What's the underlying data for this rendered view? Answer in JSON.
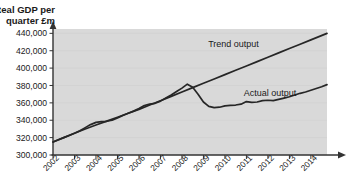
{
  "chart_data": {
    "type": "line",
    "title": "Real GDP per quarter £m",
    "title_line1": "Real GDP per",
    "title_line2": "quarter £m",
    "xlabel": "",
    "ylabel": "Real GDP per quarter £m",
    "ylim": [
      300000,
      445000
    ],
    "xlim": [
      2002,
      2014.75
    ],
    "grid": true,
    "legend_position": "inline-annotation",
    "y_ticks": [
      300000,
      320000,
      340000,
      360000,
      380000,
      400000,
      420000,
      440000
    ],
    "y_tick_labels": [
      "300,000",
      "320,000",
      "340,000",
      "360,000",
      "380,000",
      "400,000",
      "420,000",
      "440,000"
    ],
    "x_ticks": [
      2002,
      2003,
      2004,
      2005,
      2006,
      2007,
      2008,
      2009,
      2010,
      2011,
      2012,
      2013,
      2014
    ],
    "x_tick_labels": [
      "2002",
      "2003",
      "2004",
      "2005",
      "2006",
      "2007",
      "2008",
      "2009",
      "2010",
      "2011",
      "2012",
      "2013",
      "2014"
    ],
    "annotations": [
      {
        "text": "Trend output",
        "x": 2010.4,
        "y": 424000
      },
      {
        "text": "Actual output",
        "x": 2012.1,
        "y": 368000
      }
    ],
    "series": [
      {
        "name": "Trend output",
        "label": "Trend output",
        "color": "#262626",
        "x": [
          2002,
          2002.5,
          2003,
          2003.5,
          2004,
          2004.5,
          2005,
          2005.5,
          2006,
          2006.5,
          2007,
          2007.5,
          2008,
          2008.5,
          2009,
          2009.5,
          2010,
          2010.5,
          2011,
          2011.5,
          2012,
          2012.5,
          2013,
          2013.5,
          2014,
          2014.75
        ],
        "values": [
          315000,
          320000,
          325000,
          330000,
          334500,
          339000,
          343500,
          348000,
          352500,
          357500,
          362500,
          367500,
          372500,
          377500,
          382500,
          387500,
          392500,
          397500,
          402500,
          407500,
          412500,
          417500,
          422500,
          427500,
          432500,
          440000
        ]
      },
      {
        "name": "Actual output",
        "label": "Actual output",
        "color": "#262626",
        "x": [
          2002,
          2002.25,
          2002.5,
          2002.75,
          2003,
          2003.25,
          2003.5,
          2003.75,
          2004,
          2004.25,
          2004.5,
          2004.75,
          2005,
          2005.25,
          2005.5,
          2005.75,
          2006,
          2006.25,
          2006.5,
          2006.75,
          2007,
          2007.25,
          2007.5,
          2007.75,
          2008,
          2008.25,
          2008.5,
          2008.75,
          2009,
          2009.25,
          2009.5,
          2009.75,
          2010,
          2010.25,
          2010.5,
          2010.75,
          2011,
          2011.25,
          2011.5,
          2011.75,
          2012,
          2012.25,
          2012.5,
          2012.75,
          2013,
          2013.25,
          2013.5,
          2013.75,
          2014,
          2014.25,
          2014.5,
          2014.75
        ],
        "values": [
          315000,
          317500,
          320000,
          322500,
          325000,
          328000,
          331500,
          335000,
          337500,
          338500,
          338800,
          340000,
          342500,
          345500,
          348000,
          350500,
          353500,
          357000,
          358500,
          359500,
          362000,
          365500,
          369000,
          373000,
          377000,
          381500,
          378000,
          370000,
          361000,
          356000,
          354500,
          355000,
          356500,
          357000,
          357500,
          358500,
          361500,
          360500,
          361000,
          362500,
          363000,
          362500,
          364000,
          365500,
          367000,
          369000,
          371000,
          372500,
          374500,
          376500,
          378500,
          381000
        ]
      }
    ]
  }
}
